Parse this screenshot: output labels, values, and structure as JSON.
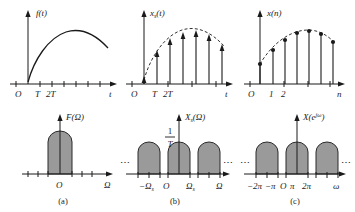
{
  "figure": {
    "colors": {
      "ink": "#1a1a1a",
      "bump_fill": "#9a9a9a",
      "bump_stroke": "#2a2a2a",
      "background": "#ffffff"
    }
  },
  "panels": {
    "top_left": {
      "signal_label": "f(t)",
      "origin_label": "O",
      "x_axis_label": "t",
      "tick_labels": [
        "T",
        "2T"
      ],
      "plot_type": "continuous-curve",
      "description": "Continuous-time signal rising from origin to a smooth maximum then decaying"
    },
    "top_middle": {
      "signal_label_base": "x",
      "signal_label_sub": "s",
      "signal_label_tail": "(t)",
      "signal_label": "xs(t)",
      "origin_label": "O",
      "x_axis_label": "t",
      "tick_labels": [
        "T",
        "2T"
      ],
      "plot_type": "impulse-train",
      "impulse_count": 7,
      "envelope": "dashed",
      "description": "Sampled signal drawn as arrow-tipped impulses under a dashed envelope"
    },
    "top_right": {
      "signal_label": "x(n)",
      "origin_label": "O",
      "x_axis_label": "n",
      "tick_labels": [
        "1",
        "2"
      ],
      "plot_type": "stem",
      "sample_count": 7,
      "envelope": "dashed",
      "description": "Discrete sequence drawn as stems with filled circular markers"
    },
    "bottom_left": {
      "signal_label": "F(Ω)",
      "origin_label": "O",
      "x_axis_label": "Ω",
      "caption": "(a)",
      "plot_type": "spectrum",
      "lobe_count": 1,
      "description": "Baseband spectrum: single rounded lobe centered at the origin"
    },
    "bottom_middle": {
      "signal_label_base": "X",
      "signal_label_sub": "s",
      "signal_label_tail": "(Ω)",
      "signal_label": "Xs(Ω)",
      "amplitude_numerator": "1",
      "amplitude_denominator": "T",
      "origin_label": "O",
      "x_axis_label": "Ω",
      "tick_labels": [
        "−Ω",
        "Ω"
      ],
      "tick_subscript": "s",
      "tick_label_left": "−Ωs",
      "tick_label_right": "Ωs",
      "ellipsis_left": "⋯",
      "ellipsis_right": "⋯",
      "caption": "(b)",
      "plot_type": "periodic-spectrum",
      "lobe_count": 3,
      "description": "Periodic repetition of the baseband spectrum with period Ωs, height 1/T"
    },
    "bottom_right": {
      "signal_label_base": "X",
      "signal_label_tail": "(e",
      "signal_label_exp": "jω",
      "signal_label_close": ")",
      "signal_label": "X(ejω)",
      "origin_label": "O",
      "x_axis_label": "ω",
      "tick_labels": [
        "−2π",
        "−π",
        "π",
        "2π"
      ],
      "ellipsis_left": "⋯",
      "ellipsis_right": "⋯",
      "caption": "(c)",
      "plot_type": "periodic-spectrum",
      "lobe_count": 3,
      "description": "Discrete-time Fourier transform, periodic with period 2π"
    }
  }
}
